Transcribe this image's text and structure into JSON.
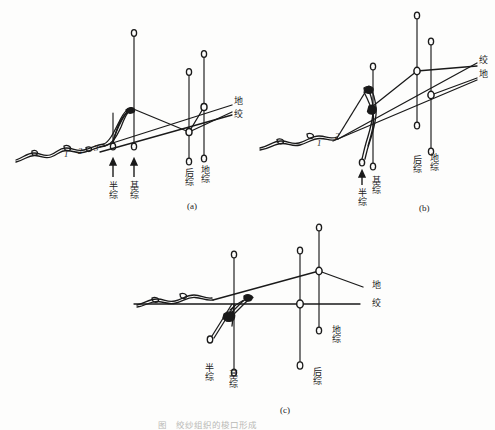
{
  "figure": {
    "title_caption": "",
    "background_color": "#fdfdfc",
    "line_color": "#1a1a1a",
    "subfigures": [
      {
        "id": "a",
        "tag": "(a)",
        "warp_numbers": [
          "1",
          "2",
          "3"
        ],
        "right_line_labels": [
          "地",
          "绞"
        ],
        "shaft_labels": [
          "半综",
          "基综",
          "后综",
          "地综"
        ],
        "arrow_marks": 2
      },
      {
        "id": "b",
        "tag": "(b)",
        "warp_numbers": [
          "1",
          "2"
        ],
        "right_line_labels": [
          "绞",
          "地"
        ],
        "shaft_labels": [
          "半综",
          "基综",
          "后综",
          "地综"
        ],
        "arrow_marks": 1
      },
      {
        "id": "c",
        "tag": "(c)",
        "warp_numbers": [],
        "right_line_labels": [
          "地",
          "绞"
        ],
        "shaft_labels": [
          "半综",
          "基综",
          "后综",
          "地综"
        ],
        "arrow_marks": 0
      }
    ]
  },
  "labels": {
    "a": {
      "n1": "1",
      "n2": "2",
      "n3": "3",
      "line_top": "地",
      "line_bottom": "绞",
      "shaft_half": "半综",
      "shaft_base": "基综",
      "shaft_back": "后综",
      "shaft_ground": "地综",
      "tag": "(a)"
    },
    "b": {
      "n1": "1",
      "n2": "2",
      "line_top": "绞",
      "line_bottom": "地",
      "shaft_half": "半综",
      "shaft_base": "基综",
      "shaft_back": "后综",
      "shaft_ground": "地综",
      "tag": "(b)"
    },
    "c": {
      "line_top": "地",
      "line_bottom": "绞",
      "shaft_half": "半综",
      "shaft_base": "基综",
      "shaft_back": "后综",
      "shaft_ground": "地综",
      "tag": "(c)"
    },
    "bottom_caption": "图    绞纱组织的梭口形成"
  }
}
